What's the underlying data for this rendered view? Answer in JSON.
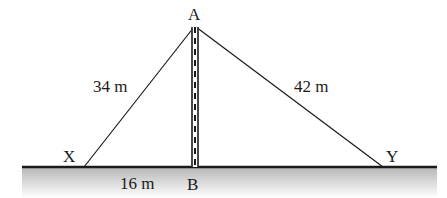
{
  "diagram": {
    "points": {
      "A": {
        "label": "A",
        "x": 195,
        "y": 26
      },
      "B": {
        "label": "B",
        "x": 195,
        "y": 167
      },
      "X": {
        "label": "X",
        "x": 84,
        "y": 167
      },
      "Y": {
        "label": "Y",
        "x": 383,
        "y": 167
      }
    },
    "lengths": {
      "AX": "34 m",
      "AY": "42 m",
      "XB": "16 m"
    },
    "colors": {
      "line": "#1a1a1a",
      "ground_top": "#b8b8b8",
      "ground_bottom": "#ffffff"
    }
  }
}
